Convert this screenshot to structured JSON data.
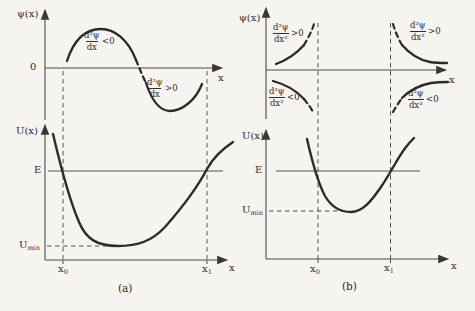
{
  "colors": {
    "background": "#f6f4f0",
    "ink": "#2d2b28",
    "axis": "#4c4a46",
    "dash": "#55524e"
  },
  "panel_a": {
    "caption": "(a)",
    "psi_plot": {
      "axis_label": "ψ(x)",
      "origin_label": "0",
      "x_label": "x",
      "concave_down": {
        "num": "d²ψ",
        "den": "dx",
        "rel": "<0"
      },
      "concave_up": {
        "num": "d²ψ",
        "den": "dx",
        "rel": ">0"
      }
    },
    "u_plot": {
      "axis_label": "U(x)",
      "energy_label": "E",
      "umin": {
        "base": "U",
        "sub": "min"
      },
      "x0": {
        "base": "x",
        "sub": "0"
      },
      "x1": {
        "base": "x",
        "sub": "1"
      },
      "x_label": "x"
    }
  },
  "panel_b": {
    "caption": "(b)",
    "psi_plot": {
      "axis_label": "ψ(x)",
      "x_label": "x",
      "upper_left": {
        "num": "d²ψ",
        "den": "dx²",
        "rel": ">0"
      },
      "upper_right": {
        "num": "d²ψ",
        "den": "dx²",
        "rel": ">0"
      },
      "lower_left": {
        "num": "d²ψ",
        "den": "dx²",
        "rel": "<0"
      },
      "lower_right": {
        "num": "d²ψ",
        "den": "dx²",
        "rel": "<0"
      }
    },
    "u_plot": {
      "axis_label": "U(x)",
      "energy_label": "E",
      "umin": {
        "base": "U",
        "sub": "min"
      },
      "x0": {
        "base": "x",
        "sub": "0"
      },
      "x1": {
        "base": "x",
        "sub": "1"
      },
      "x_label": "x"
    }
  }
}
